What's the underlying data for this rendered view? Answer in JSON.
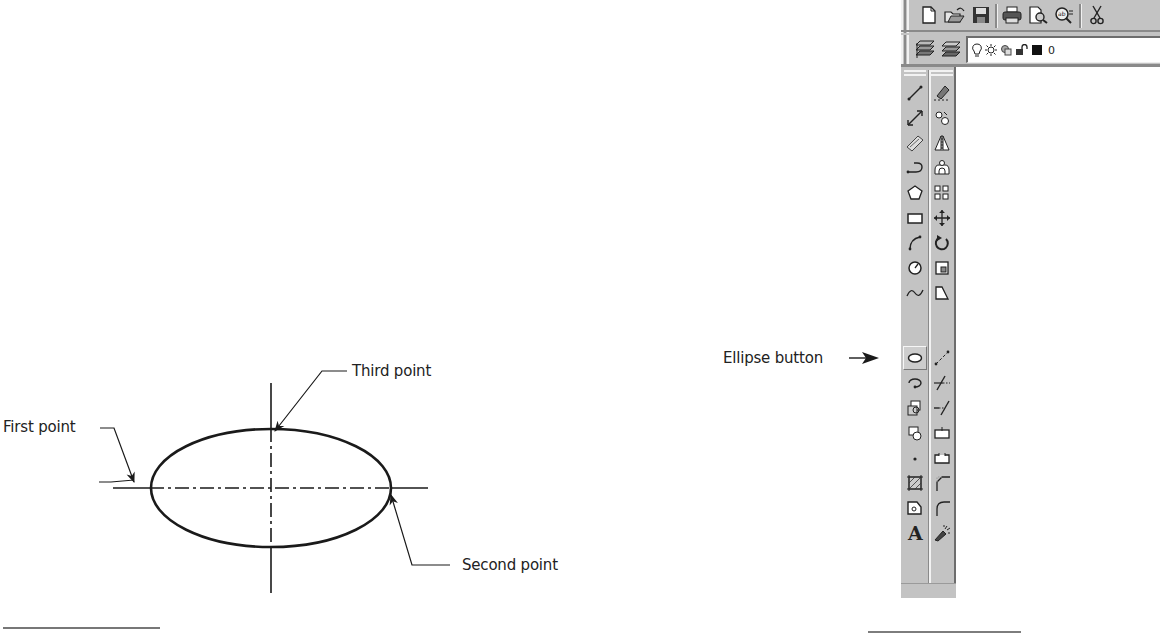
{
  "figure": {
    "labels": {
      "first_point": "First point",
      "second_point": "Second point",
      "third_point": "Third point",
      "ellipse_button": "Ellipse button"
    },
    "ellipse": {
      "center_x": 271,
      "center_y": 488,
      "rx": 120,
      "ry": 59
    }
  },
  "standard_toolbar": {
    "buttons": [
      {
        "name": "new",
        "icon": "new-document-icon"
      },
      {
        "name": "open",
        "icon": "open-folder-icon"
      },
      {
        "name": "save",
        "icon": "save-disk-icon"
      },
      {
        "name": "print",
        "icon": "printer-icon"
      },
      {
        "name": "print-preview",
        "icon": "print-preview-icon"
      },
      {
        "name": "find-replace",
        "icon": "find-replace-icon"
      },
      {
        "name": "cut",
        "icon": "scissors-icon"
      }
    ]
  },
  "layers_toolbar": {
    "buttons": [
      {
        "name": "layer-properties",
        "icon": "layer-manager-icon"
      },
      {
        "name": "make-current-layer",
        "icon": "layer-stack-icon"
      }
    ],
    "layer_combo": {
      "icons": [
        "lightbulb-icon",
        "sun-freeze-icon",
        "viewport-freeze-icon",
        "unlock-icon",
        "color-swatch-icon"
      ],
      "current_layer": "0"
    }
  },
  "draw_toolbar": {
    "items": [
      {
        "label": "Line",
        "icon": "line-icon"
      },
      {
        "label": "Construction Line",
        "icon": "xline-icon"
      },
      {
        "label": "Multiline",
        "icon": "multiline-icon"
      },
      {
        "label": "Polyline",
        "icon": "polyline-icon"
      },
      {
        "label": "Polygon",
        "icon": "polygon-icon"
      },
      {
        "label": "Rectangle",
        "icon": "rectangle-icon"
      },
      {
        "label": "Arc",
        "icon": "arc-icon"
      },
      {
        "label": "Circle",
        "icon": "circle-icon"
      },
      {
        "label": "Spline",
        "icon": "spline-icon"
      },
      {
        "label": "Ellipse",
        "icon": "ellipse-icon",
        "active": true
      },
      {
        "label": "Insert Block",
        "icon": "insert-block-icon"
      },
      {
        "label": "Make Block",
        "icon": "make-block-icon"
      },
      {
        "label": "Point",
        "icon": "point-icon"
      },
      {
        "label": "Hatch",
        "icon": "hatch-icon"
      },
      {
        "label": "Region",
        "icon": "region-icon"
      },
      {
        "label": "Multiline Text",
        "icon": "text-a-icon"
      }
    ]
  },
  "modify_toolbar": {
    "items": [
      {
        "label": "Erase",
        "icon": "eraser-icon"
      },
      {
        "label": "Copy",
        "icon": "copy-object-icon"
      },
      {
        "label": "Mirror",
        "icon": "mirror-icon"
      },
      {
        "label": "Offset",
        "icon": "offset-icon"
      },
      {
        "label": "Array",
        "icon": "array-icon"
      },
      {
        "label": "Move",
        "icon": "move-icon"
      },
      {
        "label": "Rotate",
        "icon": "rotate-icon"
      },
      {
        "label": "Scale",
        "icon": "scale-icon"
      },
      {
        "label": "Stretch",
        "icon": "stretch-icon"
      },
      {
        "label": "Lengthen",
        "icon": "lengthen-icon"
      },
      {
        "label": "Trim",
        "icon": "trim-icon"
      },
      {
        "label": "Extend",
        "icon": "extend-icon"
      },
      {
        "label": "Break at Point",
        "icon": "break-point-icon"
      },
      {
        "label": "Break",
        "icon": "break-icon"
      },
      {
        "label": "Chamfer",
        "icon": "chamfer-icon"
      },
      {
        "label": "Fillet",
        "icon": "fillet-icon"
      },
      {
        "label": "Explode",
        "icon": "explode-icon"
      }
    ]
  }
}
